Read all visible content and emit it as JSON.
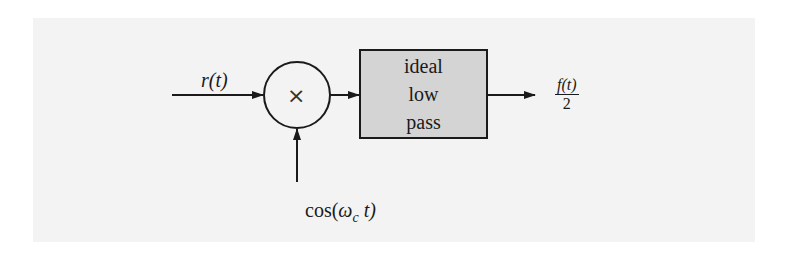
{
  "diagram": {
    "type": "block-diagram",
    "input": {
      "label": "r(t)"
    },
    "multiplier": {
      "symbol": "×"
    },
    "carrier": {
      "label": "cos(ω_c t)",
      "func": "cos(",
      "omega": "ω",
      "sub": "c",
      "arg": " t)"
    },
    "filter": {
      "lines": [
        "ideal",
        "low",
        "pass"
      ],
      "fill": "#d4d4d4"
    },
    "output": {
      "numerator": "f(t)",
      "denominator": "2"
    },
    "colors": {
      "page": "#f3f3f3",
      "stroke": "#1a1a1a"
    }
  }
}
